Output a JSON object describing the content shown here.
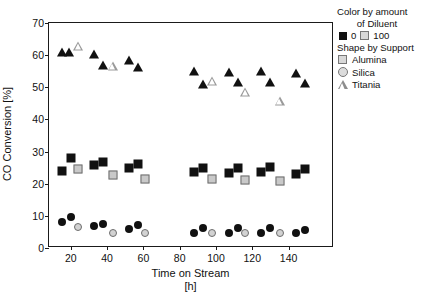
{
  "chart_data": {
    "type": "scatter",
    "title": "",
    "xlabel": "Time on Stream",
    "xlabel_unit": "[h]",
    "ylabel": "CO Conversion [%]",
    "xlim": [
      8,
      165
    ],
    "ylim": [
      0,
      70
    ],
    "xticks": [
      20,
      40,
      60,
      80,
      100,
      120,
      140
    ],
    "yticks": [
      0,
      10,
      20,
      30,
      40,
      50,
      60,
      70
    ],
    "grid": false,
    "legend_position": "right-outside",
    "series": [
      {
        "name": "Titania, Diluent 0",
        "support": "Titania",
        "diluent": "0",
        "marker": "triangle",
        "fill": "black",
        "points": [
          {
            "x": 15,
            "y": 61.0
          },
          {
            "x": 19,
            "y": 61.0
          },
          {
            "x": 33,
            "y": 60.3
          },
          {
            "x": 38,
            "y": 56.8
          },
          {
            "x": 52,
            "y": 58.5
          },
          {
            "x": 57,
            "y": 56.2
          },
          {
            "x": 88,
            "y": 55.2
          },
          {
            "x": 93,
            "y": 51.0
          },
          {
            "x": 107,
            "y": 54.8
          },
          {
            "x": 112,
            "y": 51.5
          },
          {
            "x": 125,
            "y": 55.0
          },
          {
            "x": 130,
            "y": 51.8
          },
          {
            "x": 144,
            "y": 54.5
          },
          {
            "x": 149,
            "y": 51.2
          }
        ]
      },
      {
        "name": "Titania, Diluent 100",
        "support": "Titania",
        "diluent": "100",
        "marker": "triangle",
        "fill": "open",
        "points": [
          {
            "x": 24,
            "y": 63.0
          },
          {
            "x": 43,
            "y": 59.5
          },
          {
            "x": 98,
            "y": 57.5
          },
          {
            "x": 116,
            "y": 57.0
          },
          {
            "x": 135,
            "y": 57.0
          }
        ]
      },
      {
        "name": "Alumina, Diluent 0",
        "support": "Alumina",
        "diluent": "0",
        "marker": "square",
        "fill": "black",
        "points": [
          {
            "x": 15,
            "y": 24.0
          },
          {
            "x": 20,
            "y": 28.0
          },
          {
            "x": 33,
            "y": 25.8
          },
          {
            "x": 38,
            "y": 26.7
          },
          {
            "x": 52,
            "y": 25.0
          },
          {
            "x": 57,
            "y": 26.2
          },
          {
            "x": 88,
            "y": 23.5
          },
          {
            "x": 93,
            "y": 25.0
          },
          {
            "x": 107,
            "y": 23.3
          },
          {
            "x": 112,
            "y": 25.0
          },
          {
            "x": 125,
            "y": 23.6
          },
          {
            "x": 130,
            "y": 25.1
          },
          {
            "x": 144,
            "y": 23.0
          },
          {
            "x": 149,
            "y": 24.7
          }
        ]
      },
      {
        "name": "Alumina, Diluent 100",
        "support": "Alumina",
        "diluent": "100",
        "marker": "square",
        "fill": "open",
        "points": [
          {
            "x": 24,
            "y": 24.5
          },
          {
            "x": 43,
            "y": 22.8
          },
          {
            "x": 61,
            "y": 21.5
          },
          {
            "x": 98,
            "y": 21.5
          },
          {
            "x": 116,
            "y": 21.3
          },
          {
            "x": 135,
            "y": 20.7
          }
        ]
      },
      {
        "name": "Silica, Diluent 0",
        "support": "Silica",
        "diluent": "0",
        "marker": "circle",
        "fill": "black",
        "points": [
          {
            "x": 15,
            "y": 8.2
          },
          {
            "x": 20,
            "y": 9.5
          },
          {
            "x": 33,
            "y": 6.9
          },
          {
            "x": 38,
            "y": 7.6
          },
          {
            "x": 52,
            "y": 5.9
          },
          {
            "x": 57,
            "y": 7.3
          },
          {
            "x": 88,
            "y": 4.6
          },
          {
            "x": 93,
            "y": 6.2
          },
          {
            "x": 107,
            "y": 4.6
          },
          {
            "x": 112,
            "y": 6.2
          },
          {
            "x": 125,
            "y": 4.7
          },
          {
            "x": 130,
            "y": 6.2
          },
          {
            "x": 144,
            "y": 4.6
          },
          {
            "x": 149,
            "y": 5.6
          }
        ]
      },
      {
        "name": "Silica, Diluent 100",
        "support": "Silica",
        "diluent": "100",
        "marker": "circle",
        "fill": "open",
        "points": [
          {
            "x": 24,
            "y": 6.6
          },
          {
            "x": 43,
            "y": 4.6
          },
          {
            "x": 61,
            "y": 4.7
          },
          {
            "x": 98,
            "y": 4.6
          },
          {
            "x": 116,
            "y": 4.7
          },
          {
            "x": 135,
            "y": 4.6
          }
        ]
      }
    ]
  },
  "legend": {
    "color_title_line1": "Color by amount",
    "color_title_line2": "of Diluent",
    "diluent_items": [
      {
        "label": "0",
        "marker": "square-filled"
      },
      {
        "label": "100",
        "marker": "square-open"
      }
    ],
    "shape_title": "Shape by Support",
    "shape_items": [
      {
        "label": "Alumina",
        "marker": "square-open"
      },
      {
        "label": "Silica",
        "marker": "circle-open"
      },
      {
        "label": "Titania",
        "marker": "triangle-open"
      }
    ]
  },
  "colors": {
    "marker_filled": "#111111",
    "marker_open_face": "#cfcfcf",
    "marker_open_edge": "#6d6d6d",
    "axis": "#1a1a1a",
    "background": "#ffffff"
  }
}
